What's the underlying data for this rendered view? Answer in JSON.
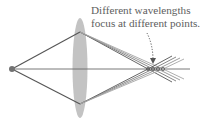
{
  "figure": {
    "caption": {
      "line1": "Different wavelengths",
      "line2": "focus at different points."
    },
    "elements": {
      "point_source": "point-source",
      "lens": "converging-lens",
      "optical_axis": "optical-axis",
      "rays": "multi-wavelength-rays",
      "annotation_arrow": "dotted-arrow"
    },
    "colors": {
      "lens": "#b5b5b5",
      "ray_primary": "#5a5a5a",
      "ray_light": "#9a9a9a",
      "source": "#6f6f6f",
      "text": "#5e5e5e"
    }
  }
}
